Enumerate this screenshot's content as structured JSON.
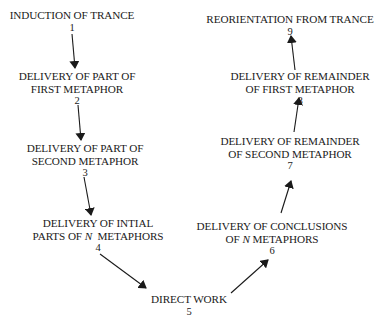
{
  "diagram": {
    "type": "flow",
    "nodes": [
      {
        "id": 1,
        "lines": [
          "INDUCTION OF TRANCE"
        ],
        "number": "1"
      },
      {
        "id": 2,
        "lines": [
          "DELIVERY OF PART OF",
          "FIRST METAPHOR"
        ],
        "number": "2"
      },
      {
        "id": 3,
        "lines": [
          "DELIVERY OF PART OF",
          "SECOND METAPHOR"
        ],
        "number": "3"
      },
      {
        "id": 4,
        "lines": [
          "DELIVERY OF INTIAL",
          "PARTS OF",
          "N",
          "METAPHORS"
        ],
        "number": "4"
      },
      {
        "id": 5,
        "lines": [
          "DIRECT WORK"
        ],
        "number": "5"
      },
      {
        "id": 6,
        "lines": [
          "DELIVERY OF CONCLUSIONS",
          "OF",
          "N",
          "METAPHORS"
        ],
        "number": "6"
      },
      {
        "id": 7,
        "lines": [
          "DELIVERY OF REMAINDER",
          "OF SECOND METAPHOR"
        ],
        "number": "7"
      },
      {
        "id": 8,
        "lines": [
          "DELIVERY OF REMAINDER",
          "OF FIRST METAPHOR"
        ],
        "number": "8"
      },
      {
        "id": 9,
        "lines": [
          "REORIENTATION FROM TRANCE"
        ],
        "number": "9"
      }
    ],
    "edges": [
      {
        "from": 1,
        "to": 2
      },
      {
        "from": 2,
        "to": 3
      },
      {
        "from": 3,
        "to": 4
      },
      {
        "from": 4,
        "to": 5
      },
      {
        "from": 5,
        "to": 6
      },
      {
        "from": 6,
        "to": 7
      },
      {
        "from": 7,
        "to": 8
      },
      {
        "from": 8,
        "to": 9
      }
    ],
    "colors": {
      "stroke": "#1a1a1a",
      "background": "#ffffff"
    }
  }
}
